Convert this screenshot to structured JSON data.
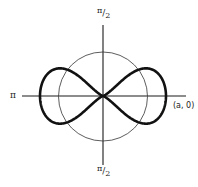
{
  "figure": {
    "labels": {
      "top": {
        "num": "π",
        "slash": "/",
        "den": "2"
      },
      "bottom": {
        "num": "π",
        "slash": "/",
        "den": "2"
      },
      "left": "π",
      "right": "(a, 0)"
    },
    "geometry": {
      "center": [
        103,
        96
      ],
      "circle_radius": 44.5,
      "curve_x_extent": [
        40,
        166
      ],
      "curve_y_extent": [
        70,
        124
      ],
      "h_axis": [
        22,
        186
      ],
      "v_axis": [
        25,
        165
      ]
    },
    "colors": {
      "stroke": "#1a1a1a",
      "background": "#ffffff"
    }
  }
}
